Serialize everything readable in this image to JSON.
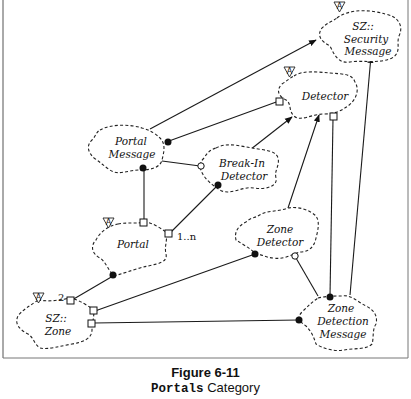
{
  "diagram": {
    "type": "Booch class category diagram",
    "classes": [
      {
        "id": "security-message",
        "line1": "SZ::",
        "line2": "Security",
        "line3": "Message",
        "abstract": true
      },
      {
        "id": "detector",
        "line1": "Detector",
        "abstract": true
      },
      {
        "id": "portal-message",
        "line1": "Portal",
        "line2": "Message",
        "abstract": false
      },
      {
        "id": "break-in-detector",
        "line1": "Break-In",
        "line2": "Detector",
        "abstract": false
      },
      {
        "id": "portal",
        "line1": "Portal",
        "abstract": true
      },
      {
        "id": "zone-detector",
        "line1": "Zone",
        "line2": "Detector",
        "abstract": false
      },
      {
        "id": "zone",
        "line1": "SZ::",
        "line2": "Zone",
        "abstract": true
      },
      {
        "id": "zone-detection-message",
        "line1": "Zone",
        "line2": "Detection",
        "line3": "Message",
        "abstract": false
      }
    ],
    "abstract_adornment": "A",
    "multiplicities": {
      "portal_to_break_in": "1..n",
      "zone_to_portal": "2"
    },
    "relationships": [
      {
        "from": "portal-message",
        "to": "security-message",
        "kind": "inheritance"
      },
      {
        "from": "portal-message",
        "to": "detector",
        "kind": "has-by-value"
      },
      {
        "from": "portal-message",
        "to": "break-in-detector",
        "kind": "uses"
      },
      {
        "from": "portal",
        "to": "portal-message",
        "kind": "has-by-value"
      },
      {
        "from": "portal",
        "to": "break-in-detector",
        "kind": "has-by-value"
      },
      {
        "from": "break-in-detector",
        "to": "detector",
        "kind": "inheritance"
      },
      {
        "from": "zone-detector",
        "to": "detector",
        "kind": "inheritance"
      },
      {
        "from": "zone",
        "to": "portal",
        "kind": "has-by-value"
      },
      {
        "from": "zone",
        "to": "zone-detector",
        "kind": "has-by-value"
      },
      {
        "from": "zone",
        "to": "zone-detection-message",
        "kind": "has-by-value"
      },
      {
        "from": "zone-detection-message",
        "to": "zone-detector",
        "kind": "uses"
      },
      {
        "from": "detector",
        "to": "zone-detection-message",
        "kind": "has-by-value"
      },
      {
        "from": "zone-detection-message",
        "to": "security-message",
        "kind": "inheritance"
      }
    ]
  },
  "caption": {
    "figure": "Figure 6-11",
    "name_mono": "Portals",
    "name_rest": " Category"
  }
}
